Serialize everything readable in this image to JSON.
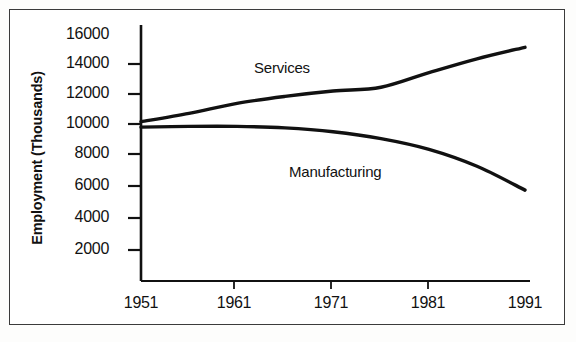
{
  "figure": {
    "background_color": "#ffffff",
    "frame_color": "#3b3b3b",
    "ink_color": "#111111"
  },
  "chart_data": {
    "type": "line",
    "title": "",
    "xlabel": "",
    "ylabel": "Employment (Thousands)",
    "xlim": [
      1951,
      1991
    ],
    "ylim": [
      0,
      16000
    ],
    "yticks": [
      2000,
      4000,
      6000,
      8000,
      10000,
      12000,
      14000,
      16000
    ],
    "ytick_labels": [
      "2000",
      "4000",
      "6000",
      "8000",
      "10000",
      "12000",
      "14000",
      "16000"
    ],
    "xticks": [
      1951,
      1961,
      1971,
      1981,
      1991
    ],
    "xtick_labels": [
      "1951",
      "1961",
      "1971",
      "1981",
      "1991"
    ],
    "grid": false,
    "legend_position": "inline-annotation",
    "annotations": [
      {
        "text": "Services",
        "x": 1966,
        "y": 12900
      },
      {
        "text": "Manufacturing",
        "x": 1974,
        "y": 7600
      }
    ],
    "x": [
      1951,
      1956,
      1961,
      1966,
      1971,
      1976,
      1981,
      1986,
      1991
    ],
    "series": [
      {
        "name": "Services",
        "color": "#111111",
        "values": [
          10350,
          10900,
          11550,
          12000,
          12350,
          12600,
          13550,
          14450,
          15200
        ]
      },
      {
        "name": "Manufacturing",
        "color": "#111111",
        "values": [
          10000,
          10050,
          10050,
          9950,
          9700,
          9250,
          8550,
          7450,
          5900
        ]
      }
    ]
  },
  "ytick_positions_px": [
    250,
    218,
    186,
    154,
    124,
    94,
    64,
    35
  ],
  "xtick_positions_px": [
    141,
    234,
    331,
    428,
    525
  ],
  "labels": {
    "y_axis_title": "Employment (Thousands)",
    "series_services": "Services",
    "series_manufacturing": "Manufacturing"
  }
}
